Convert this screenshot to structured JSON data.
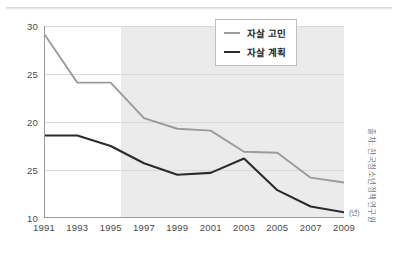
{
  "chart_data": {
    "type": "line",
    "title": "",
    "subtitle": "",
    "xlabel": "(년)",
    "ylabel": "",
    "x": [
      1991,
      1993,
      1995,
      1997,
      1999,
      2001,
      2003,
      2005,
      2007,
      2009
    ],
    "categories": [
      "1991",
      "1993",
      "1995",
      "1997",
      "1999",
      "2001",
      "2003",
      "2005",
      "2007",
      "2009"
    ],
    "series": [
      {
        "name": "자살 고민",
        "color": "#9b9b9b",
        "values": [
          29.2,
          24.1,
          24.1,
          20.4,
          19.3,
          19.1,
          16.9,
          16.8,
          14.2,
          13.7
        ]
      },
      {
        "name": "자살 계획",
        "color": "#2b2b2b",
        "values": [
          18.6,
          18.6,
          17.5,
          15.7,
          14.5,
          14.7,
          16.2,
          12.9,
          11.2,
          10.6
        ]
      }
    ],
    "ylim": [
      10,
      30
    ],
    "xlim": [
      1991,
      2009
    ],
    "ytick_labels": [
      "30",
      "25",
      "20",
      "25",
      "10"
    ],
    "ytick_values": [
      30,
      25,
      20,
      15,
      10
    ],
    "grid": true,
    "grid_color": "#d9d9d9",
    "legend_position": "top-right",
    "shaded_region": {
      "from": 1995.6,
      "to": 2009,
      "color": "#ebebeb"
    },
    "annotations": {
      "unit_marker": "(년)",
      "source_note": "출처: 한국청소년정책연구원"
    }
  },
  "legend": {
    "items": [
      {
        "label": "자살 고민",
        "style": "gray"
      },
      {
        "label": "자살 계획",
        "style": "black"
      }
    ]
  },
  "axes": {
    "y_ticks": [
      "30",
      "25",
      "20",
      "25",
      "10"
    ],
    "x_ticks": [
      "1991",
      "1993",
      "1995",
      "1997",
      "1999",
      "2001",
      "2003",
      "2005",
      "2007",
      "2009"
    ]
  },
  "notes": {
    "unit": "(년)",
    "source": "출처: 한국청소년정책연구원"
  }
}
